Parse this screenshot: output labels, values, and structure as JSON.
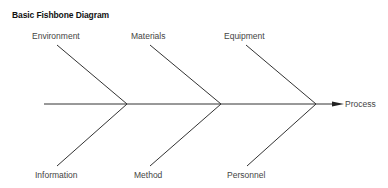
{
  "title": "Basic Fishbone Diagram",
  "effect": "Process",
  "colors": {
    "line": "#333333",
    "text": "#444444"
  },
  "spine": {
    "x1": 44,
    "y": 104,
    "x2": 334,
    "arrow_tip": 344
  },
  "causes_top": [
    {
      "label": "Environment",
      "x1": 57,
      "y1": 45,
      "x2": 127,
      "y2": 104,
      "lx": 32,
      "ly": 39
    },
    {
      "label": "Materials",
      "x1": 150,
      "y1": 45,
      "x2": 221,
      "y2": 104,
      "lx": 131,
      "ly": 39
    },
    {
      "label": "Equipment",
      "x1": 246,
      "y1": 45,
      "x2": 316,
      "y2": 104,
      "lx": 224,
      "ly": 39
    }
  ],
  "causes_bottom": [
    {
      "label": "Information",
      "x1": 127,
      "y1": 104,
      "x2": 57,
      "y2": 166,
      "lx": 35,
      "ly": 178
    },
    {
      "label": "Method",
      "x1": 221,
      "y1": 104,
      "x2": 150,
      "y2": 166,
      "lx": 134,
      "ly": 178
    },
    {
      "label": "Personnel",
      "x1": 316,
      "y1": 104,
      "x2": 247,
      "y2": 166,
      "lx": 227,
      "ly": 178
    }
  ]
}
